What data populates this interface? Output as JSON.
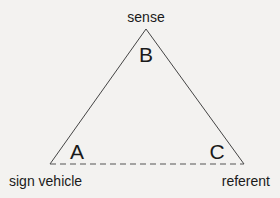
{
  "diagram": {
    "type": "semiotic-triangle",
    "vertices": {
      "apex": {
        "letter": "B",
        "label": "sense"
      },
      "left": {
        "letter": "A",
        "label": "sign vehicle"
      },
      "right": {
        "letter": "C",
        "label": "referent"
      }
    },
    "edges": [
      {
        "from": "A",
        "to": "B",
        "style": "solid"
      },
      {
        "from": "B",
        "to": "C",
        "style": "solid"
      },
      {
        "from": "A",
        "to": "C",
        "style": "dashed"
      }
    ],
    "colors": {
      "background": "#f3f2f0",
      "line": "#444444",
      "text": "#1a1a1a"
    }
  }
}
